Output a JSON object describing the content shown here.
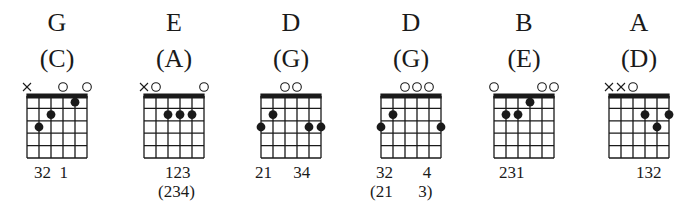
{
  "diagram": {
    "type": "guitar-chord-charts",
    "strings": 6,
    "frets_shown": 5,
    "colors": {
      "ink": "#1a1a1a",
      "background": "#ffffff"
    }
  },
  "chords": [
    {
      "name": "G",
      "alt_name": "(C)",
      "open_muted": [
        "x",
        "",
        "",
        "o",
        "",
        "o"
      ],
      "dots": [
        {
          "string": 1,
          "fret": 3
        },
        {
          "string": 2,
          "fret": 2
        },
        {
          "string": 4,
          "fret": 1
        }
      ],
      "fingering": "32  1",
      "fingering_alt": ""
    },
    {
      "name": "E",
      "alt_name": "(A)",
      "open_muted": [
        "x",
        "o",
        "",
        "",
        "",
        "o"
      ],
      "dots": [
        {
          "string": 2,
          "fret": 2
        },
        {
          "string": 3,
          "fret": 2
        },
        {
          "string": 4,
          "fret": 2
        }
      ],
      "fingering": "123",
      "fingering_alt": "(234)"
    },
    {
      "name": "D",
      "alt_name": "(G)",
      "open_muted": [
        "",
        "",
        "o",
        "o",
        "",
        ""
      ],
      "dots": [
        {
          "string": 0,
          "fret": 3
        },
        {
          "string": 1,
          "fret": 2
        },
        {
          "string": 4,
          "fret": 3
        },
        {
          "string": 5,
          "fret": 3
        }
      ],
      "fingering": "21     34",
      "fingering_alt": ""
    },
    {
      "name": "D",
      "alt_name": "(G)",
      "open_muted": [
        "",
        "",
        "o",
        "o",
        "o",
        ""
      ],
      "dots": [
        {
          "string": 0,
          "fret": 3
        },
        {
          "string": 1,
          "fret": 2
        },
        {
          "string": 5,
          "fret": 3
        }
      ],
      "fingering": "32       4",
      "fingering_alt": "(21      3)"
    },
    {
      "name": "B",
      "alt_name": "(E)",
      "open_muted": [
        "o",
        "",
        "",
        "",
        "o",
        "o"
      ],
      "dots": [
        {
          "string": 1,
          "fret": 2
        },
        {
          "string": 2,
          "fret": 2
        },
        {
          "string": 3,
          "fret": 1
        }
      ],
      "fingering": "231",
      "fingering_alt": ""
    },
    {
      "name": "A",
      "alt_name": "(D)",
      "open_muted": [
        "x",
        "x",
        "o",
        "",
        "",
        ""
      ],
      "dots": [
        {
          "string": 3,
          "fret": 2
        },
        {
          "string": 4,
          "fret": 3
        },
        {
          "string": 5,
          "fret": 2
        }
      ],
      "fingering": "132",
      "fingering_alt": ""
    }
  ]
}
